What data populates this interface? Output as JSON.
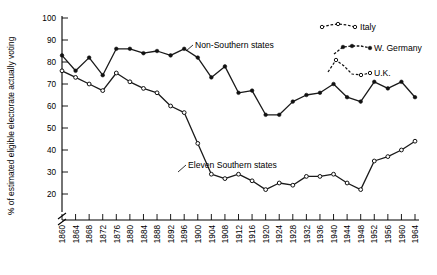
{
  "chart_data": {
    "type": "line",
    "title": "",
    "xlabel": "",
    "ylabel": "% of estimated eligible electorate actually voting",
    "ylim": [
      18,
      102
    ],
    "yticks": [
      20,
      30,
      40,
      50,
      60,
      70,
      80,
      90,
      100
    ],
    "axis_break": true,
    "grid": false,
    "legend_position": "upper-right-inset",
    "categories": [
      1860,
      1864,
      1868,
      1872,
      1876,
      1880,
      1884,
      1888,
      1892,
      1896,
      1900,
      1904,
      1908,
      1912,
      1916,
      1920,
      1924,
      1928,
      1932,
      1936,
      1940,
      1944,
      1948,
      1952,
      1956,
      1960,
      1964
    ],
    "xticklabels": [
      "1860",
      "1864",
      "1868",
      "1872",
      "1876",
      "1880",
      "1884",
      "1888",
      "1892",
      "1896",
      "1900",
      "1904",
      "1908",
      "1912",
      "1916",
      "1920",
      "1924",
      "1928",
      "1932",
      "1936",
      "1940",
      "1944",
      "1948",
      "1952",
      "1956",
      "1960",
      "1964"
    ],
    "series": [
      {
        "name": "Non-Southern states",
        "marker": "filled-circle",
        "linestyle": "solid",
        "values": [
          83,
          76,
          82,
          74,
          86,
          86,
          84,
          85,
          83,
          86,
          82,
          73,
          78,
          66,
          67,
          56,
          56,
          62,
          65,
          66,
          70,
          64,
          62,
          71,
          68,
          71,
          64
        ]
      },
      {
        "name": "Eleven Southern states",
        "marker": "open-circle",
        "linestyle": "solid",
        "values": [
          76,
          73,
          70,
          67,
          75,
          71,
          68,
          66,
          60,
          57,
          43,
          29,
          27,
          29,
          26,
          22,
          25,
          24,
          28,
          28,
          29,
          25,
          22,
          35,
          37,
          40,
          44
        ]
      }
    ],
    "annotations": [
      {
        "text": "Non-Southern states",
        "series": "Non-Southern states"
      },
      {
        "text": "Eleven Southern states",
        "series": "Eleven Southern states"
      }
    ],
    "legend": [
      {
        "label": "Italy",
        "marker": "open-circle",
        "linestyle": "dashed"
      },
      {
        "label": "W. Germany",
        "marker": "filled-circle",
        "linestyle": "dashed"
      },
      {
        "label": "U.K.",
        "marker": "open-circle",
        "linestyle": "dashed"
      }
    ],
    "colors": {
      "line": "#111111",
      "axis": "#000000",
      "background": "#ffffff"
    }
  }
}
